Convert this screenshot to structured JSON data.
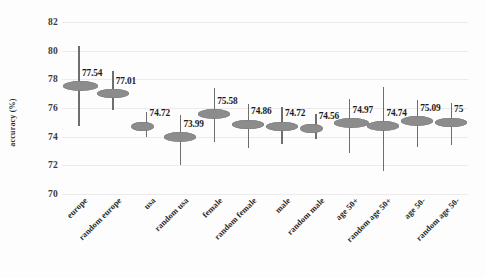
{
  "chart_data": {
    "type": "scatter",
    "title": "",
    "subtitle": "",
    "xlabel": "",
    "ylabel": "accuracy (%)",
    "ylim": [
      70,
      82
    ],
    "yticks": [
      70,
      72,
      74,
      76,
      78,
      80,
      82
    ],
    "grid": true,
    "legend": "none",
    "marker_color": "#8c8c8c",
    "whisker_color": "#6e6e6e",
    "categories": [
      "europe",
      "random europe",
      "usa",
      "random usa",
      "female",
      "random female",
      "male",
      "random male",
      "age 50+",
      "random age 50+",
      "age 50-",
      "random age 50-"
    ],
    "values": [
      77.54,
      77.01,
      74.72,
      73.99,
      75.58,
      74.86,
      74.72,
      74.56,
      74.97,
      74.74,
      75.09,
      75
    ],
    "value_labels": [
      "77.54",
      "77.01",
      "74.72",
      "73.99",
      "75.58",
      "74.86",
      "74.72",
      "74.56",
      "74.97",
      "74.74",
      "75.09",
      "75"
    ],
    "error_low": [
      74.75,
      75.85,
      74.0,
      72.0,
      73.6,
      73.2,
      73.5,
      73.85,
      72.85,
      71.6,
      73.3,
      73.4
    ],
    "error_high": [
      80.35,
      78.55,
      75.75,
      75.5,
      77.4,
      76.3,
      76.1,
      75.6,
      76.6,
      77.5,
      76.55,
      76.35
    ]
  }
}
